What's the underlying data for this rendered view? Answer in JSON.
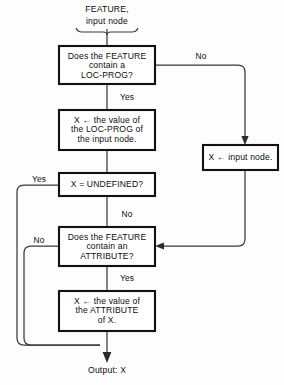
{
  "diagram": {
    "type": "flowchart",
    "title_caption": "FEATURE, input node",
    "input_label_line1": "FEATURE,",
    "input_label_line2": "input node",
    "output_label": "Output: X",
    "colors": {
      "background": "#fdfdfd",
      "box_fill": "#ffffff",
      "box_stroke": "#111111",
      "line_stroke": "#3a3a3a",
      "text": "#0d0d0d"
    },
    "nodes": [
      {
        "id": "decide-locprog",
        "kind": "decision",
        "lines": [
          "Does the FEATURE",
          "contain a",
          "LOC-PROG?"
        ]
      },
      {
        "id": "assign-locprog",
        "kind": "process",
        "lines": [
          "X ← the value of",
          "the LOC-PROG of",
          "the input node."
        ]
      },
      {
        "id": "assign-input-node",
        "kind": "process",
        "lines": [
          "X ← input node."
        ]
      },
      {
        "id": "decide-undefined",
        "kind": "decision",
        "lines": [
          "X = UNDEFINED?"
        ]
      },
      {
        "id": "decide-attribute",
        "kind": "decision",
        "lines": [
          "Does the FEATURE",
          "contain an",
          "ATTRIBUTE?"
        ]
      },
      {
        "id": "assign-attribute",
        "kind": "process",
        "lines": [
          "X ← the value of",
          "the ATTRIBUTE",
          "of X."
        ]
      }
    ],
    "edge_labels": {
      "locprog_no": "No",
      "locprog_yes": "Yes",
      "undefined_yes": "Yes",
      "undefined_no": "No",
      "attribute_no": "No",
      "attribute_yes": "Yes"
    },
    "edges": [
      {
        "from": "input",
        "to": "decide-locprog",
        "label": ""
      },
      {
        "from": "decide-locprog",
        "to": "assign-input-node",
        "label": "No"
      },
      {
        "from": "decide-locprog",
        "to": "assign-locprog",
        "label": "Yes"
      },
      {
        "from": "assign-locprog",
        "to": "decide-undefined",
        "label": ""
      },
      {
        "from": "decide-undefined",
        "to": "output",
        "label": "Yes"
      },
      {
        "from": "decide-undefined",
        "to": "decide-attribute",
        "label": "No"
      },
      {
        "from": "assign-input-node",
        "to": "decide-attribute",
        "label": ""
      },
      {
        "from": "decide-attribute",
        "to": "output",
        "label": "No"
      },
      {
        "from": "decide-attribute",
        "to": "assign-attribute",
        "label": "Yes"
      },
      {
        "from": "assign-attribute",
        "to": "output",
        "label": ""
      }
    ]
  }
}
